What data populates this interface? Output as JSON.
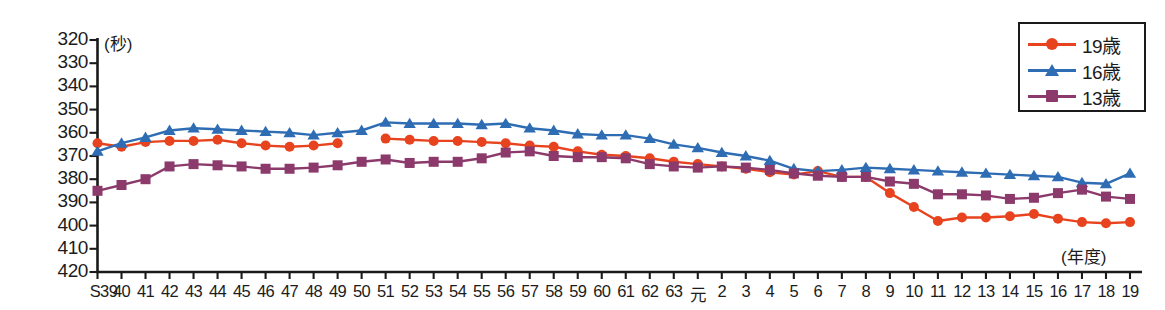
{
  "chart_data": {
    "type": "line",
    "title": "",
    "subtitle": "",
    "xlabel": "(年度)",
    "ylabel": "(秒)",
    "y_unit": "秒",
    "y_axis_inverted": true,
    "ylim": [
      320,
      420
    ],
    "yticks": [
      320,
      330,
      340,
      350,
      360,
      370,
      380,
      390,
      400,
      410,
      420
    ],
    "grid": false,
    "legend_position": "top-right",
    "categories": [
      "S39",
      "40",
      "41",
      "42",
      "43",
      "44",
      "45",
      "46",
      "47",
      "48",
      "49",
      "50",
      "51",
      "52",
      "53",
      "54",
      "55",
      "56",
      "57",
      "58",
      "59",
      "60",
      "61",
      "62",
      "63",
      "元",
      "2",
      "3",
      "4",
      "5",
      "6",
      "7",
      "8",
      "9",
      "10",
      "11",
      "12",
      "13",
      "14",
      "15",
      "16",
      "17",
      "18",
      "19"
    ],
    "series": [
      {
        "name": "19歳",
        "color": "#E8431F",
        "marker": "circle",
        "values": [
          364.5,
          366.0,
          364.0,
          363.5,
          363.5,
          363.0,
          364.5,
          365.5,
          366.0,
          365.5,
          364.5,
          null,
          362.5,
          363.0,
          363.5,
          363.5,
          364.0,
          364.5,
          365.5,
          366.0,
          368.0,
          369.5,
          370.0,
          371.0,
          372.5,
          373.5,
          374.5,
          375.5,
          377.0,
          378.0,
          376.5,
          379.0,
          379.0,
          386.0,
          392.0,
          398.0,
          396.5,
          396.5,
          396.0,
          395.0,
          397.0,
          398.5,
          399.0,
          398.5
        ]
      },
      {
        "name": "16歳",
        "color": "#2E6DB4",
        "marker": "triangle",
        "values": [
          368.0,
          364.5,
          362.0,
          359.0,
          358.0,
          358.5,
          359.0,
          359.5,
          360.0,
          361.0,
          360.0,
          359.0,
          355.5,
          356.0,
          356.0,
          356.0,
          356.5,
          356.0,
          358.0,
          359.0,
          360.5,
          361.0,
          361.0,
          362.5,
          365.0,
          366.5,
          368.5,
          370.0,
          372.0,
          375.5,
          376.5,
          376.0,
          375.0,
          375.5,
          376.0,
          376.5,
          377.0,
          377.5,
          378.0,
          378.5,
          379.0,
          381.5,
          382.0,
          377.5
        ]
      },
      {
        "name": "13歳",
        "color": "#8B3A6B",
        "marker": "square",
        "values": [
          385.0,
          382.5,
          380.0,
          374.5,
          373.5,
          374.0,
          374.5,
          375.5,
          375.5,
          375.0,
          374.0,
          372.5,
          371.5,
          373.0,
          372.5,
          372.5,
          371.0,
          368.5,
          368.0,
          370.0,
          370.5,
          370.5,
          371.0,
          373.5,
          374.5,
          375.0,
          374.5,
          375.0,
          376.0,
          377.5,
          378.5,
          379.0,
          379.0,
          381.0,
          382.0,
          386.5,
          386.5,
          387.0,
          388.5,
          388.0,
          386.0,
          384.5,
          387.5,
          388.5
        ]
      }
    ]
  },
  "legend": {
    "items": [
      {
        "label": "19歳",
        "color": "#E8431F",
        "marker": "circle"
      },
      {
        "label": "16歳",
        "color": "#2E6DB4",
        "marker": "triangle"
      },
      {
        "label": "13歳",
        "color": "#8B3A6B",
        "marker": "square"
      }
    ]
  },
  "axes": {
    "y_unit_label": "(秒)",
    "x_caption": "(年度)"
  },
  "colors": {
    "series_19": "#E8431F",
    "series_16": "#2E6DB4",
    "series_13": "#8B3A6B",
    "axis": "#1a1a1a",
    "background": "#ffffff"
  }
}
